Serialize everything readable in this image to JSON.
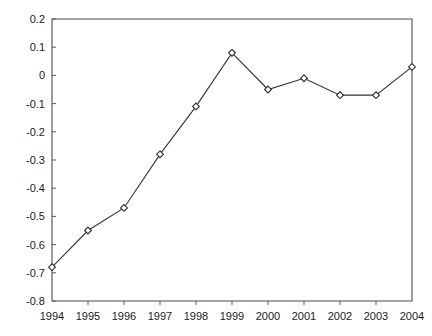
{
  "chart_data": {
    "type": "line",
    "title": "",
    "subtitle": "",
    "xlabel": "",
    "ylabel": "",
    "categories": [
      "1994",
      "1995",
      "1996",
      "1997",
      "1998",
      "1999",
      "2000",
      "2001",
      "2002",
      "2003",
      "2004"
    ],
    "values": [
      -0.68,
      -0.55,
      -0.47,
      -0.28,
      -0.11,
      0.08,
      -0.05,
      -0.01,
      -0.07,
      -0.07,
      0.03
    ],
    "series": [
      {
        "name": "",
        "values": [
          -0.68,
          -0.55,
          -0.47,
          -0.28,
          -0.11,
          0.08,
          -0.05,
          -0.01,
          -0.07,
          -0.07,
          0.03
        ]
      }
    ],
    "x_tick_labels": [
      "1994",
      "1995",
      "1996",
      "1997",
      "1998",
      "1999",
      "2000",
      "2001",
      "2002",
      "2003",
      "2004"
    ],
    "y_tick_labels": [
      "0.2",
      "0.1",
      "0",
      "-0.1",
      "-0.2",
      "-0.3",
      "-0.4",
      "-0.5",
      "-0.6",
      "-0.7",
      "-0.8"
    ],
    "y_tick_values": [
      0.2,
      0.1,
      0,
      -0.1,
      -0.2,
      -0.3,
      -0.4,
      -0.5,
      -0.6,
      -0.7,
      -0.8
    ],
    "ylim": [
      -0.8,
      0.2
    ],
    "xlim": [
      "1994",
      "2004"
    ],
    "grid": false,
    "legend": false,
    "legend_position": "none",
    "marker": "diamond-open",
    "line_color": "#333333",
    "marker_fill": "#ffffff",
    "marker_stroke": "#2b2b2b",
    "axis_color": "#4d4d4d",
    "background_color": "#ffffff",
    "annotations": []
  }
}
